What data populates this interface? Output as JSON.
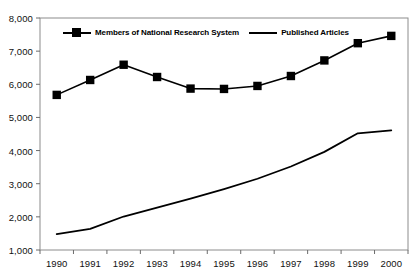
{
  "chart_data": {
    "type": "line",
    "title": "",
    "subtitle": "",
    "xlabel": "",
    "ylabel": "",
    "categories": [
      "1990",
      "1991",
      "1992",
      "1993",
      "1994",
      "1995",
      "1996",
      "1997",
      "1998",
      "1999",
      "2000"
    ],
    "x": [
      1990,
      1991,
      1992,
      1993,
      1994,
      1995,
      1996,
      1997,
      1998,
      1999,
      2000
    ],
    "ylim": [
      1000,
      8000
    ],
    "yticks": [
      1000,
      2000,
      3000,
      4000,
      5000,
      6000,
      7000,
      8000
    ],
    "ytick_labels": [
      "1,000",
      "2,000",
      "3,000",
      "4,000",
      "5,000",
      "6,000",
      "7,000",
      "8,000"
    ],
    "grid": false,
    "legend_position": "top-center",
    "series": [
      {
        "name": "Members of National Research System",
        "marker": "square",
        "values": [
          5680,
          6130,
          6590,
          6220,
          5870,
          5860,
          5950,
          6250,
          6720,
          7240,
          7460
        ]
      },
      {
        "name": "Published Articles",
        "marker": "none",
        "values": [
          1480,
          1640,
          2010,
          2280,
          2550,
          2840,
          3150,
          3520,
          3960,
          4520,
          4610
        ]
      }
    ]
  },
  "legend": {
    "entries": [
      {
        "label": "Members of National Research System",
        "symbol": "line-with-square-marker"
      },
      {
        "label": "Published Articles",
        "symbol": "plain-line"
      }
    ]
  },
  "colors": {
    "series_line": "#000000",
    "marker_fill": "#000000",
    "axis": "#6b6b6b",
    "background": "#ffffff"
  }
}
